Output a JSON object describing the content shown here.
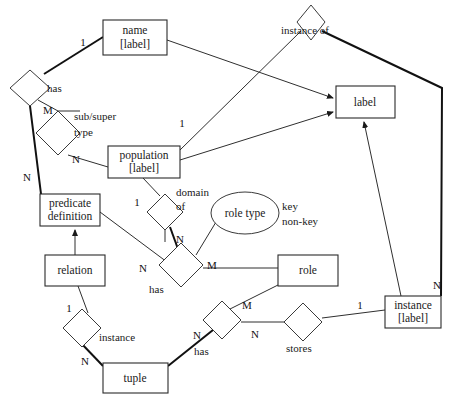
{
  "diagram": {
    "background_color": "#ffffff",
    "line_color": "#2f2f2f",
    "text_color": "#1a1a1a",
    "width": 458,
    "height": 408,
    "entities": [
      {
        "id": "name",
        "line1": "name",
        "line2": "[label]",
        "x": 103,
        "y": 20,
        "w": 64,
        "h": 35
      },
      {
        "id": "label",
        "line1": "label",
        "line2": "",
        "x": 336,
        "y": 86,
        "w": 59,
        "h": 32
      },
      {
        "id": "population",
        "line1": "population",
        "line2": "[label]",
        "x": 108,
        "y": 146,
        "w": 72,
        "h": 32
      },
      {
        "id": "predicate",
        "line1": "predicate",
        "line2": "definition",
        "x": 40,
        "y": 194,
        "w": 60,
        "h": 32
      },
      {
        "id": "relation",
        "line1": "relation",
        "line2": "",
        "x": 45,
        "y": 255,
        "w": 60,
        "h": 31
      },
      {
        "id": "role",
        "line1": "role",
        "line2": "",
        "x": 278,
        "y": 255,
        "w": 60,
        "h": 31
      },
      {
        "id": "instance",
        "line1": "instance",
        "line2": "[label]",
        "x": 385,
        "y": 296,
        "w": 56,
        "h": 32
      },
      {
        "id": "tuple",
        "line1": "tuple",
        "line2": "",
        "x": 103,
        "y": 363,
        "w": 65,
        "h": 30
      }
    ],
    "relationships": [
      {
        "id": "has-name",
        "label": "has",
        "cx": 30,
        "cy": 88,
        "rx": 20,
        "ry": 18,
        "label_x": 47,
        "label_y": 89
      },
      {
        "id": "subsuper",
        "label": "sub/super",
        "label2": "type",
        "cx": 58,
        "cy": 133,
        "rx": 22,
        "ry": 22,
        "label_x": 76,
        "label_y": 117,
        "label2_x": 76,
        "label2_y": 133
      },
      {
        "id": "instance-of",
        "label": "instance of",
        "cx": 311,
        "cy": 22,
        "rx": 14,
        "ry": 19,
        "label_x": 283,
        "label_y": 34
      },
      {
        "id": "domain-of",
        "label": "domain",
        "label2": "of",
        "cx": 165,
        "cy": 212,
        "rx": 18,
        "ry": 18,
        "label_x": 177,
        "label_y": 193,
        "label2_x": 177,
        "label2_y": 206
      },
      {
        "id": "has-role",
        "label": "has",
        "cx": 181,
        "cy": 265,
        "rx": 22,
        "ry": 22,
        "label_x": 150,
        "label_y": 289
      },
      {
        "id": "instance-rel",
        "label": "instance",
        "cx": 82,
        "cy": 328,
        "rx": 19,
        "ry": 19,
        "label_x": 99,
        "label_y": 339
      },
      {
        "id": "has-tuple",
        "label": "has",
        "cx": 222,
        "cy": 320,
        "rx": 19,
        "ry": 19,
        "label_x": 195,
        "label_y": 353
      },
      {
        "id": "stores",
        "label": "stores",
        "cx": 303,
        "cy": 322,
        "rx": 19,
        "ry": 19,
        "label_x": 288,
        "label_y": 347
      }
    ],
    "attributes": [
      {
        "id": "role-type",
        "label": "role type",
        "cx": 245,
        "cy": 213,
        "rx": 34,
        "ry": 21
      }
    ],
    "notes": [
      {
        "id": "key-note",
        "text": "key",
        "x": 278,
        "y": 206
      },
      {
        "id": "nonkey-note",
        "text": "non-key",
        "x": 278,
        "y": 221
      }
    ],
    "cardinalities": [
      {
        "id": "c-name-1",
        "text": "1",
        "x": 83,
        "y": 42
      },
      {
        "id": "c-has-M",
        "text": "M",
        "x": 48,
        "y": 110
      },
      {
        "id": "c-subsuper-N",
        "text": "N",
        "x": 76,
        "y": 159
      },
      {
        "id": "c-has-N",
        "text": "N",
        "x": 27,
        "y": 177
      },
      {
        "id": "c-pop-1",
        "text": "1",
        "x": 182,
        "y": 123
      },
      {
        "id": "c-domain-1",
        "text": "1",
        "x": 137,
        "y": 202
      },
      {
        "id": "c-domain-N",
        "text": "N",
        "x": 180,
        "y": 239
      },
      {
        "id": "c-has-role-N",
        "text": "N",
        "x": 143,
        "y": 268
      },
      {
        "id": "c-has-role-M",
        "text": "M",
        "x": 210,
        "y": 265
      },
      {
        "id": "c-relation-1",
        "text": "1",
        "x": 69,
        "y": 308
      },
      {
        "id": "c-tuple-N",
        "text": "N",
        "x": 85,
        "y": 361
      },
      {
        "id": "c-tuple-M",
        "text": "M",
        "x": 245,
        "y": 305
      },
      {
        "id": "c-tuple-N2",
        "text": "N",
        "x": 197,
        "y": 335
      },
      {
        "id": "c-stores-N",
        "text": "N",
        "x": 253,
        "y": 334
      },
      {
        "id": "c-stores-1",
        "text": "1",
        "x": 360,
        "y": 305
      },
      {
        "id": "c-instance-N",
        "text": "N",
        "x": 437,
        "y": 285
      }
    ]
  }
}
